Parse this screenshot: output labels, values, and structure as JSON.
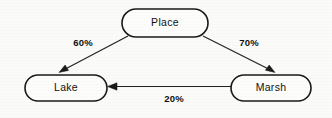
{
  "diagram": {
    "type": "directed-graph",
    "background_color": "#fbfbf9",
    "stroke_color": "#1a1a1a",
    "node_fill_color": "#fdfdfc",
    "nodes": [
      {
        "id": "place",
        "label": "Place",
        "shape": "stadium",
        "cx": 165,
        "cy": 23,
        "width": 86,
        "height": 28
      },
      {
        "id": "lake",
        "label": "Lake",
        "shape": "stadium",
        "cx": 66,
        "cy": 88,
        "width": 82,
        "height": 26
      },
      {
        "id": "marsh",
        "label": "Marsh",
        "shape": "stadium",
        "cx": 271,
        "cy": 88,
        "width": 80,
        "height": 26
      }
    ],
    "edges": [
      {
        "id": "place-to-lake",
        "from": "place",
        "to": "lake",
        "label": "60%",
        "label_x": 83,
        "label_y": 43,
        "direction": "down-left"
      },
      {
        "id": "place-to-marsh",
        "from": "place",
        "to": "marsh",
        "label": "70%",
        "label_x": 249,
        "label_y": 43,
        "direction": "down-right"
      },
      {
        "id": "marsh-to-lake",
        "from": "marsh",
        "to": "lake",
        "label": "20%",
        "label_x": 174,
        "label_y": 98,
        "direction": "left"
      }
    ]
  }
}
